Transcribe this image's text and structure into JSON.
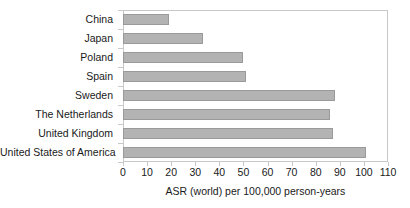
{
  "chart_data": {
    "type": "bar",
    "orientation": "horizontal",
    "title": "",
    "xlabel": "ASR (world) per 100,000 person-years",
    "ylabel": "",
    "xlim": [
      0,
      110
    ],
    "xticks": [
      0,
      10,
      20,
      30,
      40,
      50,
      60,
      70,
      80,
      90,
      100,
      110
    ],
    "grid": false,
    "legend": false,
    "bar_color": "#b3b3b3",
    "bar_border_color": "#9a9a9a",
    "frame_color": "#c9c9c9",
    "categories": [
      "China",
      "Japan",
      "Poland",
      "Spain",
      "Sweden",
      "The Netherlands",
      "United Kingdom",
      "United States of America"
    ],
    "values": [
      19,
      33,
      50,
      51,
      88,
      86,
      87,
      101
    ]
  }
}
